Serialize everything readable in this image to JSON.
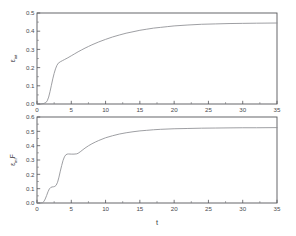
{
  "figure": {
    "background_color": "#ffffff",
    "axis_color": "#55565a",
    "curve_color": "#8d8e92",
    "text_color": "#3a3b3f"
  },
  "top_panel": {
    "ylabel_symbol": "ε",
    "ylabel_subscript": "int",
    "xlabel": "t",
    "y_ticks": [
      "0.0",
      "0.1",
      "0.2",
      "0.3",
      "0.4",
      "0.5"
    ],
    "x_ticks": [
      "0",
      "5",
      "10",
      "15",
      "20",
      "25",
      "30",
      "35"
    ]
  },
  "bottom_panel": {
    "ylabel_symbol": "ε",
    "ylabel_subscript": "inf",
    "ylabel_suffix": "F",
    "xlabel": "t",
    "y_ticks": [
      "0.0",
      "0.1",
      "0.2",
      "0.3",
      "0.4",
      "0.5",
      "0.6"
    ],
    "x_ticks": [
      "0",
      "5",
      "10",
      "15",
      "20",
      "25",
      "30",
      "35"
    ]
  },
  "chart_data": [
    {
      "type": "line",
      "panel": "top",
      "title": "",
      "xlabel": "t",
      "ylabel": "ε_int",
      "xlim": [
        0,
        35
      ],
      "ylim": [
        0.0,
        0.5
      ],
      "xtick_values": [
        0,
        5,
        10,
        15,
        20,
        25,
        30,
        35
      ],
      "ytick_values": [
        0.0,
        0.1,
        0.2,
        0.3,
        0.4,
        0.5
      ],
      "grid": false,
      "legend": false,
      "series": [
        {
          "name": "ε_int",
          "x": [
            0.0,
            0.5,
            1.0,
            1.3,
            1.5,
            1.7,
            1.9,
            2.1,
            2.3,
            2.5,
            2.7,
            2.9,
            3.1,
            3.4,
            3.7,
            4.0,
            4.5,
            5.0,
            5.5,
            6.0,
            6.5,
            7.0,
            7.5,
            8.0,
            9.0,
            10.0,
            11.0,
            12.0,
            13.0,
            14.0,
            15.0,
            16.0,
            17.0,
            18.0,
            19.0,
            20.0,
            22.0,
            24.0,
            26.0,
            28.0,
            30.0,
            32.0,
            35.0
          ],
          "y": [
            0.0,
            0.0,
            0.003,
            0.008,
            0.018,
            0.038,
            0.068,
            0.103,
            0.138,
            0.168,
            0.193,
            0.212,
            0.224,
            0.232,
            0.238,
            0.244,
            0.254,
            0.265,
            0.276,
            0.287,
            0.297,
            0.307,
            0.316,
            0.325,
            0.341,
            0.355,
            0.368,
            0.379,
            0.389,
            0.397,
            0.405,
            0.411,
            0.417,
            0.421,
            0.425,
            0.429,
            0.434,
            0.438,
            0.44,
            0.442,
            0.443,
            0.444,
            0.445
          ]
        }
      ]
    },
    {
      "type": "line",
      "panel": "bottom",
      "title": "",
      "xlabel": "t",
      "ylabel": "ε_inf F",
      "xlim": [
        0,
        35
      ],
      "ylim": [
        0.0,
        0.6
      ],
      "xtick_values": [
        0,
        5,
        10,
        15,
        20,
        25,
        30,
        35
      ],
      "ytick_values": [
        0.0,
        0.1,
        0.2,
        0.3,
        0.4,
        0.5,
        0.6
      ],
      "grid": false,
      "legend": false,
      "series": [
        {
          "name": "ε_inf F",
          "x": [
            0.0,
            0.5,
            0.8,
            1.0,
            1.2,
            1.4,
            1.6,
            1.8,
            2.0,
            2.2,
            2.4,
            2.6,
            2.8,
            3.0,
            3.2,
            3.4,
            3.6,
            3.8,
            4.0,
            4.2,
            4.4,
            4.6,
            5.0,
            5.4,
            5.8,
            6.0,
            6.3,
            6.7,
            7.0,
            7.5,
            8.0,
            8.5,
            9.0,
            10.0,
            11.0,
            12.0,
            13.0,
            14.0,
            15.0,
            16.0,
            17.0,
            18.0,
            20.0,
            22.0,
            24.0,
            26.0,
            28.0,
            30.0,
            32.0,
            35.0
          ],
          "y": [
            0.0,
            0.0,
            0.002,
            0.01,
            0.028,
            0.052,
            0.078,
            0.098,
            0.108,
            0.112,
            0.113,
            0.116,
            0.124,
            0.145,
            0.18,
            0.222,
            0.262,
            0.297,
            0.322,
            0.336,
            0.341,
            0.342,
            0.341,
            0.341,
            0.343,
            0.347,
            0.357,
            0.372,
            0.383,
            0.399,
            0.413,
            0.425,
            0.436,
            0.455,
            0.469,
            0.481,
            0.49,
            0.497,
            0.503,
            0.507,
            0.511,
            0.514,
            0.518,
            0.52,
            0.522,
            0.523,
            0.524,
            0.525,
            0.525,
            0.526
          ]
        }
      ]
    }
  ]
}
